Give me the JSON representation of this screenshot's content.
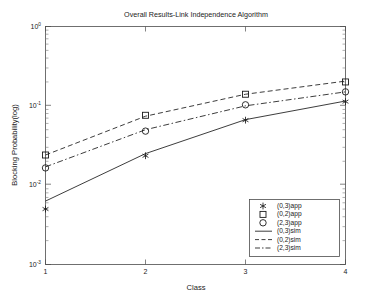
{
  "chart_data": {
    "type": "line",
    "title": "Overall Results-Link Independence Algorithm",
    "xlabel": "Class",
    "ylabel": "Blocking Probability(log)",
    "xlim": [
      1,
      4
    ],
    "ylim": [
      0.001,
      1
    ],
    "yscale": "log",
    "grid": false,
    "legend_position": "lower-right",
    "categories": [
      1,
      2,
      3,
      4
    ],
    "xticklabels": [
      "1",
      "2",
      "3",
      "4"
    ],
    "ytick_mantissa": [
      "10",
      "10",
      "10",
      "10"
    ],
    "ytick_exponent": [
      "0",
      "-1",
      "-2",
      "-3"
    ],
    "yticks": [
      1,
      0.1,
      0.01,
      0.001
    ],
    "series": [
      {
        "name": "(0,3)app",
        "marker": "star",
        "style": "markers",
        "values": [
          0.005,
          0.0235,
          0.066,
          0.113
        ]
      },
      {
        "name": "(0,2)app",
        "marker": "square",
        "style": "markers",
        "values": [
          0.024,
          0.076,
          0.14,
          0.2
        ]
      },
      {
        "name": "(2,3)app",
        "marker": "circle",
        "style": "markers",
        "values": [
          0.0165,
          0.048,
          0.103,
          0.15
        ]
      },
      {
        "name": "(0,3)sim",
        "marker": "none",
        "style": "solid",
        "values": [
          0.0063,
          0.025,
          0.067,
          0.115
        ]
      },
      {
        "name": "(0,2)sim",
        "marker": "none",
        "style": "dashed",
        "values": [
          0.024,
          0.074,
          0.14,
          0.205
        ]
      },
      {
        "name": "(2,3)sim",
        "marker": "none",
        "style": "dashdot",
        "values": [
          0.017,
          0.05,
          0.1,
          0.15
        ]
      }
    ],
    "legend": [
      {
        "label": "(0,3)app",
        "glyph": "star-marker"
      },
      {
        "label": "(0,2)app",
        "glyph": "square-marker"
      },
      {
        "label": "(2,3)app",
        "glyph": "circle-marker"
      },
      {
        "label": "(0,3)sim",
        "glyph": "solid-line"
      },
      {
        "label": "(0,2)sim",
        "glyph": "dashed-line"
      },
      {
        "label": "(2,3)sim",
        "glyph": "dashdot-line"
      }
    ],
    "colors": {
      "axis": "#4d4d4d",
      "ink": "#1a1a1a",
      "background": "#ffffff"
    }
  }
}
